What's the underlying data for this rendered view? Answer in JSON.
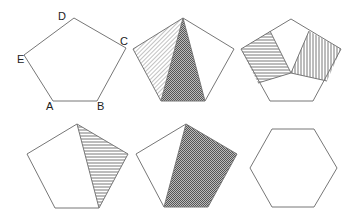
{
  "diagram": {
    "labels": {
      "A": "A",
      "B": "B",
      "C": "C",
      "D": "D",
      "E": "E"
    },
    "colors": {
      "stroke": "#777777",
      "hatch": "#555555",
      "background": "#ffffff"
    },
    "figures": [
      {
        "id": "pentagon-labeled",
        "shading": "none"
      },
      {
        "id": "pentagon-two-triangles",
        "shading": "diagonal-hatch triangle + crosshatch triangle"
      },
      {
        "id": "pentagon-two-quads",
        "shading": "horizontal-hatch quad + vertical-hatch quad"
      },
      {
        "id": "pentagon-one-triangle",
        "shading": "horizontal-hatch triangle"
      },
      {
        "id": "pentagon-quadrilateral",
        "shading": "crosshatch quadrilateral"
      },
      {
        "id": "hexagon",
        "shading": "none"
      }
    ]
  }
}
